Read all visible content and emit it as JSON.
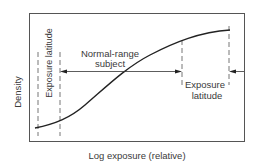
{
  "diagram": {
    "type": "characteristic-curve",
    "ylabel": "Density",
    "xlabel": "Log exposure (relative)",
    "labels": {
      "left_latitude": "Exposure latitude",
      "center_line1": "Normal-range",
      "center_line2": "subject",
      "right_latitude_line1": "Exposure",
      "right_latitude_line2": "latitude"
    },
    "colors": {
      "line": "#222222",
      "text": "#3a3a3a",
      "frame": "#555555"
    }
  }
}
